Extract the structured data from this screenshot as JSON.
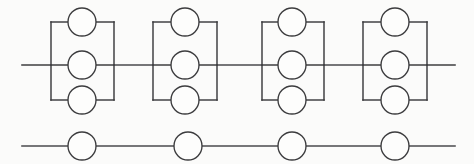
{
  "diagram": {
    "canvas": {
      "width": 474,
      "height": 164,
      "background": "#fbfbfa"
    },
    "style": {
      "line_color": "#3b3b3d",
      "node_fill": "#fdfdfc",
      "line_width": 1.45
    },
    "lines": [
      {
        "name": "main-horizontal-line",
        "x1": 22,
        "y1": 65,
        "x2": 455,
        "y2": 65
      },
      {
        "name": "lower-horizontal-line",
        "x1": 22,
        "y1": 146,
        "x2": 455,
        "y2": 146
      }
    ],
    "parallel_groups": [
      {
        "label": "group-1",
        "left_x": 51,
        "right_x": 114,
        "center_x": 82,
        "top_y": 22,
        "mid_y": 65,
        "bottom_y": 100,
        "radius": 14,
        "nodes": [
          {
            "name": "group-1-node-top",
            "cx": 82,
            "cy": 22,
            "r": 14
          },
          {
            "name": "group-1-node-middle",
            "cx": 82,
            "cy": 65,
            "r": 14
          },
          {
            "name": "group-1-node-bottom",
            "cx": 82,
            "cy": 100,
            "r": 14
          }
        ]
      },
      {
        "label": "group-2",
        "left_x": 153,
        "right_x": 217,
        "center_x": 185,
        "top_y": 22,
        "mid_y": 65,
        "bottom_y": 100,
        "radius": 14,
        "nodes": [
          {
            "name": "group-2-node-top",
            "cx": 185,
            "cy": 22,
            "r": 14
          },
          {
            "name": "group-2-node-middle",
            "cx": 185,
            "cy": 65,
            "r": 14
          },
          {
            "name": "group-2-node-bottom",
            "cx": 185,
            "cy": 100,
            "r": 14
          }
        ]
      },
      {
        "label": "group-3",
        "left_x": 262,
        "right_x": 324,
        "center_x": 292,
        "top_y": 22,
        "mid_y": 65,
        "bottom_y": 100,
        "radius": 14,
        "nodes": [
          {
            "name": "group-3-node-top",
            "cx": 292,
            "cy": 22,
            "r": 14
          },
          {
            "name": "group-3-node-middle",
            "cx": 292,
            "cy": 65,
            "r": 14
          },
          {
            "name": "group-3-node-bottom",
            "cx": 292,
            "cy": 100,
            "r": 14
          }
        ]
      },
      {
        "label": "group-4",
        "left_x": 363,
        "right_x": 427,
        "center_x": 395,
        "top_y": 22,
        "mid_y": 65,
        "bottom_y": 100,
        "radius": 14,
        "nodes": [
          {
            "name": "group-4-node-top",
            "cx": 395,
            "cy": 22,
            "r": 14
          },
          {
            "name": "group-4-node-middle",
            "cx": 395,
            "cy": 65,
            "r": 14
          },
          {
            "name": "group-4-node-bottom",
            "cx": 395,
            "cy": 100,
            "r": 14
          }
        ]
      }
    ],
    "series_nodes": [
      {
        "name": "series-node-1",
        "cx": 82,
        "cy": 146,
        "r": 14
      },
      {
        "name": "series-node-2",
        "cx": 188,
        "cy": 146,
        "r": 14
      },
      {
        "name": "series-node-3",
        "cx": 292,
        "cy": 146,
        "r": 14
      },
      {
        "name": "series-node-4",
        "cx": 395,
        "cy": 146,
        "r": 14
      }
    ]
  }
}
